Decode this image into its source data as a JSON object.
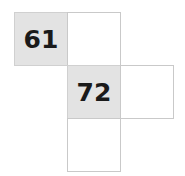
{
  "figure": {
    "kind": "grid-net-diagram",
    "background_color": "#ffffff",
    "border_color": "#c9c9c9",
    "shaded_fill_color": "#e3e3e3",
    "text_color": "#1a1a1a",
    "cell_size_px": 53,
    "cells": [
      {
        "id": "top-left",
        "row": 1,
        "col": 1,
        "shaded": true,
        "label": "61"
      },
      {
        "id": "top-right",
        "row": 1,
        "col": 2,
        "shaded": false,
        "label": ""
      },
      {
        "id": "mid-left",
        "row": 2,
        "col": 2,
        "shaded": true,
        "label": "72"
      },
      {
        "id": "mid-right",
        "row": 2,
        "col": 3,
        "shaded": false,
        "label": ""
      },
      {
        "id": "bottom",
        "row": 3,
        "col": 2,
        "shaded": false,
        "label": ""
      }
    ]
  }
}
